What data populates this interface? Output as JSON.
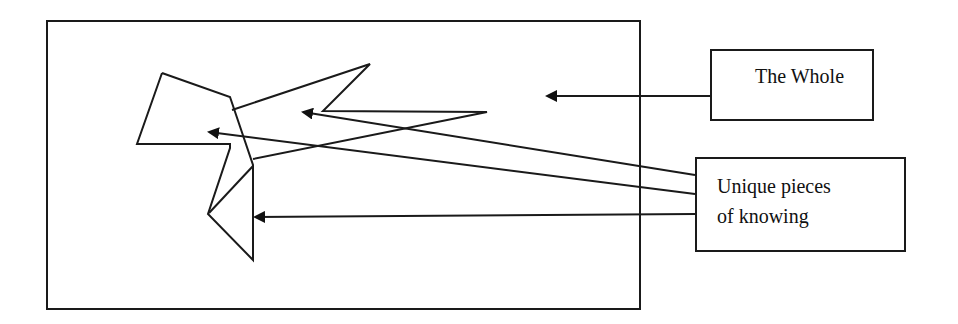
{
  "diagram": {
    "background": "#ffffff",
    "stroke_color": "#1a1a1a",
    "whole_frame": {
      "x": 47,
      "y": 21,
      "width": 593,
      "height": 288
    },
    "labels": {
      "the_whole": {
        "text": "The Whole",
        "box": {
          "x": 710,
          "y": 49,
          "width": 164,
          "height": 72
        }
      },
      "unique_pieces": {
        "lines": [
          "Unique pieces",
          "of knowing"
        ],
        "box": {
          "x": 695,
          "y": 157,
          "width": 211,
          "height": 95
        }
      }
    },
    "shapes": {
      "left_polygon": [
        [
          162,
          73
        ],
        [
          230,
          97
        ],
        [
          253,
          165
        ],
        [
          253,
          260
        ],
        [
          208,
          214
        ],
        [
          230,
          148
        ],
        [
          230,
          144
        ],
        [
          137,
          144
        ],
        [
          162,
          73
        ]
      ],
      "inner_diagonal": [
        [
          253,
          166
        ],
        [
          209,
          213
        ]
      ],
      "star_arm": [
        [
          232,
          110
        ],
        [
          370,
          64
        ],
        [
          323,
          111
        ],
        [
          487,
          112
        ],
        [
          253,
          159
        ]
      ]
    },
    "arrows": [
      {
        "name": "arrow-the-whole",
        "from": [
          710,
          96
        ],
        "to": [
          547,
          96
        ]
      },
      {
        "name": "arrow-piece-1",
        "from": [
          695,
          175
        ],
        "to": [
          303,
          112
        ]
      },
      {
        "name": "arrow-piece-2",
        "from": [
          695,
          194
        ],
        "to": [
          209,
          132
        ]
      },
      {
        "name": "arrow-piece-3",
        "from": [
          695,
          214
        ],
        "to": [
          255,
          217
        ]
      }
    ]
  }
}
